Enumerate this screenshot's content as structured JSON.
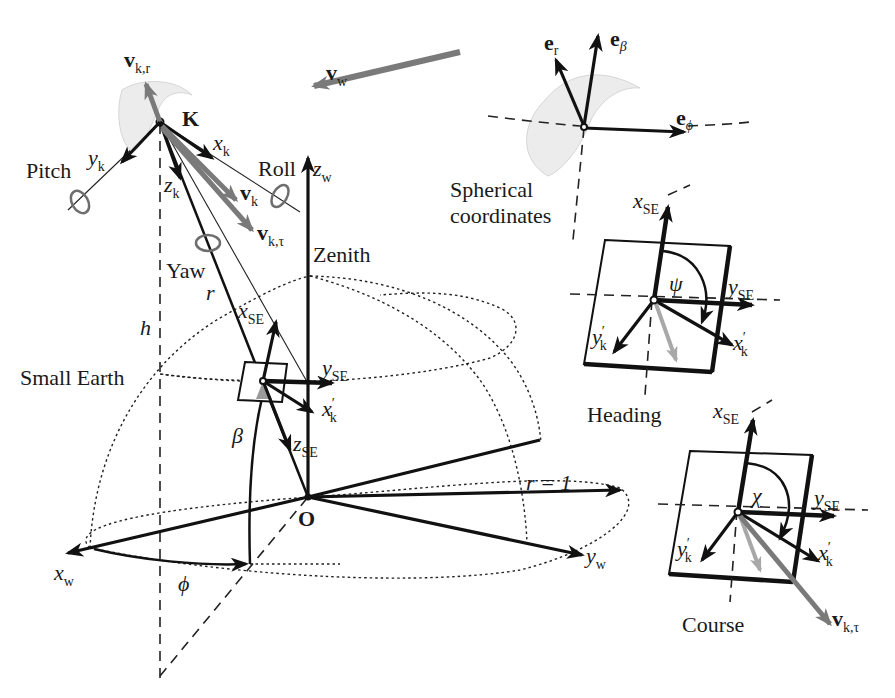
{
  "figure": {
    "colors": {
      "ink": "#111111",
      "vector_gray": "#7a7a7a",
      "light_gray": "#a8a8a8",
      "kite_fill": "#ececec",
      "background": "#ffffff"
    }
  },
  "main": {
    "kite_point": "K",
    "origin": "O",
    "zenith": "Zenith",
    "small_earth": "Small Earth",
    "pitch": "Pitch",
    "roll": "Roll",
    "yaw": "Yaw",
    "r": "r",
    "h": "h",
    "beta": "β",
    "phi": "ϕ",
    "r_eq_1": "r = 1",
    "vectors": {
      "v_kr": {
        "base": "v",
        "sub": "k,r"
      },
      "v_w": {
        "base": "v",
        "sub": "w"
      },
      "v_k": {
        "base": "v",
        "sub": "k"
      },
      "v_ktau": {
        "base": "v",
        "sub": "k,τ"
      }
    },
    "axes": {
      "x_k": {
        "base": "x",
        "sub": "k"
      },
      "y_k": {
        "base": "y",
        "sub": "k"
      },
      "z_k": {
        "base": "z",
        "sub": "k"
      },
      "z_w": {
        "base": "z",
        "sub": "w"
      },
      "x_w": {
        "base": "x",
        "sub": "w"
      },
      "y_w": {
        "base": "y",
        "sub": "w"
      },
      "x_se": {
        "base": "x",
        "sub": "SE"
      },
      "y_se": {
        "base": "y",
        "sub": "SE"
      },
      "z_se": {
        "base": "z",
        "sub": "SE"
      },
      "x_k_prime": {
        "base": "x",
        "sub": "k",
        "prime": "′"
      }
    }
  },
  "spherical_inset": {
    "caption_line1": "Spherical",
    "caption_line2": "coordinates",
    "e_r": {
      "base": "e",
      "sub": "r"
    },
    "e_beta": {
      "base": "e",
      "sub": "β"
    },
    "e_phi": {
      "base": "e",
      "sub": "ϕ"
    }
  },
  "heading_inset": {
    "caption": "Heading",
    "angle": "ψ",
    "x_se": {
      "base": "x",
      "sub": "SE"
    },
    "y_se": {
      "base": "y",
      "sub": "SE"
    },
    "x_k_prime": {
      "base": "x",
      "sub": "k",
      "prime": "′"
    },
    "y_k_prime": {
      "base": "y",
      "sub": "k",
      "prime": "′"
    }
  },
  "course_inset": {
    "caption": "Course",
    "angle": "χ",
    "x_se": {
      "base": "x",
      "sub": "SE"
    },
    "y_se": {
      "base": "y",
      "sub": "SE"
    },
    "x_k_prime": {
      "base": "x",
      "sub": "k",
      "prime": "′"
    },
    "y_k_prime": {
      "base": "y",
      "sub": "k",
      "prime": "′"
    },
    "v_ktau": {
      "base": "v",
      "sub": "k,τ"
    }
  }
}
